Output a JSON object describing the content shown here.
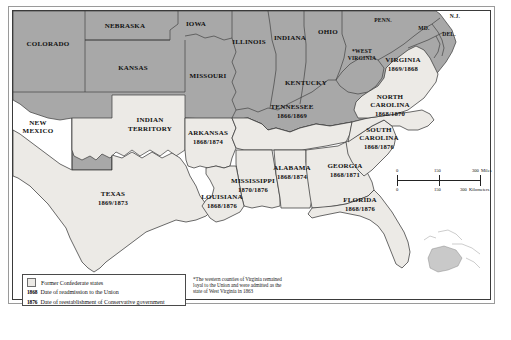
{
  "map": {
    "title_context": "Reconstruction of the South",
    "colors": {
      "union_fill": "#a8a8a8",
      "confederate_fill": "#eceae6",
      "water_fill": "#ffffff",
      "border_stroke": "#3a3a3a",
      "frame_stroke": "#3a3a3a",
      "text": "#111111"
    },
    "union_states": [
      {
        "key": "colorado",
        "name": "COLORADO"
      },
      {
        "key": "nebraska",
        "name": "NEBRASKA"
      },
      {
        "key": "kansas",
        "name": "KANSAS"
      },
      {
        "key": "iowa",
        "name": "IOWA"
      },
      {
        "key": "missouri",
        "name": "MISSOURI"
      },
      {
        "key": "illinois",
        "name": "ILLINOIS"
      },
      {
        "key": "indiana",
        "name": "INDIANA"
      },
      {
        "key": "ohio",
        "name": "OHIO"
      },
      {
        "key": "kentucky",
        "name": "KENTUCKY"
      },
      {
        "key": "new_mexico",
        "name": "NEW\nMEXICO",
        "line1": "NEW",
        "line2": "MEXICO"
      },
      {
        "key": "penn",
        "name": "PENN."
      },
      {
        "key": "md",
        "name": "MD."
      },
      {
        "key": "nj",
        "name": "N.J."
      },
      {
        "key": "del",
        "name": "DEL."
      },
      {
        "key": "west_virginia",
        "line1": "*WEST",
        "line2": "VIRGINIA"
      },
      {
        "key": "indian_territory",
        "line1": "INDIAN",
        "line2": "TERRITORY"
      }
    ],
    "confederate_states": [
      {
        "key": "texas",
        "name": "TEXAS",
        "dates": "1869/1873"
      },
      {
        "key": "arkansas",
        "name": "ARKANSAS",
        "dates": "1868/1874"
      },
      {
        "key": "louisiana",
        "name": "LOUISIANA",
        "dates": "1868/1876"
      },
      {
        "key": "mississippi",
        "name": "MISSISSIPPI",
        "dates": "1870/1876"
      },
      {
        "key": "alabama",
        "name": "ALABAMA",
        "dates": "1868/1874"
      },
      {
        "key": "tennessee",
        "name": "TENNESSEE",
        "dates": "1866/1869"
      },
      {
        "key": "georgia",
        "name": "GEORGIA",
        "dates": "1868/1871"
      },
      {
        "key": "florida",
        "name": "FLORIDA",
        "dates": "1868/1876"
      },
      {
        "key": "south_carolina",
        "line1": "SOUTH",
        "line2": "CAROLINA",
        "dates": "1868/1876"
      },
      {
        "key": "north_carolina",
        "line1": "NORTH",
        "line2": "CAROLINA",
        "dates": "1868/1870"
      },
      {
        "key": "virginia",
        "name": "VIRGINIA",
        "dates": "1869/1868"
      }
    ]
  },
  "legend": {
    "swatch_label": "Former Confederate states",
    "rows": [
      {
        "year": "1868",
        "text": "Date of readmission to the Union"
      },
      {
        "year": "1876",
        "text": "Date of reestablishment of Conservative government"
      }
    ]
  },
  "footnote": {
    "text": "*The western counties of Virginia remained loyal to the Union and were admitted as the state of West Virginia in 1863"
  },
  "scalebar": {
    "miles": {
      "ticks": [
        "0",
        "150",
        "300"
      ],
      "unit": "Miles"
    },
    "kilometers": {
      "ticks": [
        "0",
        "150",
        "300"
      ],
      "unit": "Kilometers"
    }
  }
}
